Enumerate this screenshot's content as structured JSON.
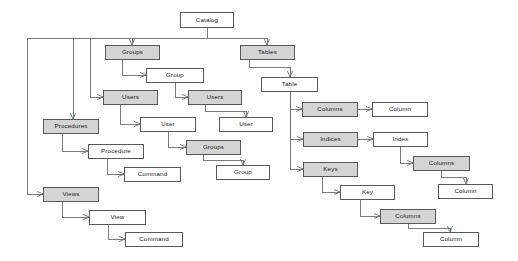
{
  "diagram": {
    "type": "tree-diagram",
    "style": {
      "shaded_fill": "#d4d4d4",
      "plain_fill": "#ffffff",
      "border_color": "#595959",
      "edge_color": "#6e6e6e",
      "background": "#ffffff"
    },
    "nodes": [
      {
        "id": "catalog",
        "label": "Catalog",
        "fill": "plain",
        "x": 180,
        "y": 12,
        "w": 54,
        "h": 16
      },
      {
        "id": "groups",
        "label": "Groups",
        "fill": "shaded",
        "x": 105,
        "y": 45,
        "w": 55,
        "h": 15
      },
      {
        "id": "group",
        "label": "Group",
        "fill": "plain",
        "x": 146,
        "y": 68,
        "w": 58,
        "h": 15
      },
      {
        "id": "users",
        "label": "Users",
        "fill": "shaded",
        "x": 103,
        "y": 90,
        "w": 55,
        "h": 15
      },
      {
        "id": "user",
        "label": "User",
        "fill": "plain",
        "x": 140,
        "y": 117,
        "w": 56,
        "h": 15
      },
      {
        "id": "users2",
        "label": "Users",
        "fill": "shaded",
        "x": 188,
        "y": 90,
        "w": 54,
        "h": 15
      },
      {
        "id": "user2",
        "label": "User",
        "fill": "plain",
        "x": 219,
        "y": 117,
        "w": 54,
        "h": 15
      },
      {
        "id": "groups2",
        "label": "Groups",
        "fill": "shaded",
        "x": 186,
        "y": 140,
        "w": 55,
        "h": 15
      },
      {
        "id": "group2",
        "label": "Group",
        "fill": "plain",
        "x": 216,
        "y": 165,
        "w": 54,
        "h": 15
      },
      {
        "id": "procedures",
        "label": "Procedures",
        "fill": "shaded",
        "x": 43,
        "y": 119,
        "w": 56,
        "h": 15
      },
      {
        "id": "procedure",
        "label": "Procedure",
        "fill": "plain",
        "x": 88,
        "y": 144,
        "w": 56,
        "h": 15
      },
      {
        "id": "proc_command",
        "label": "Command",
        "fill": "plain",
        "x": 124,
        "y": 167,
        "w": 57,
        "h": 15
      },
      {
        "id": "views",
        "label": "Views",
        "fill": "shaded",
        "x": 43,
        "y": 187,
        "w": 56,
        "h": 15
      },
      {
        "id": "view",
        "label": "View",
        "fill": "plain",
        "x": 89,
        "y": 210,
        "w": 57,
        "h": 15
      },
      {
        "id": "view_command",
        "label": "Command",
        "fill": "plain",
        "x": 125,
        "y": 232,
        "w": 58,
        "h": 15
      },
      {
        "id": "tables",
        "label": "Tables",
        "fill": "shaded",
        "x": 240,
        "y": 45,
        "w": 55,
        "h": 15
      },
      {
        "id": "table",
        "label": "Table",
        "fill": "plain",
        "x": 261,
        "y": 77,
        "w": 57,
        "h": 15
      },
      {
        "id": "columns",
        "label": "Columns",
        "fill": "shaded",
        "x": 302,
        "y": 102,
        "w": 56,
        "h": 15
      },
      {
        "id": "column",
        "label": "Column",
        "fill": "plain",
        "x": 372,
        "y": 102,
        "w": 56,
        "h": 15
      },
      {
        "id": "indices",
        "label": "Indices",
        "fill": "shaded",
        "x": 303,
        "y": 132,
        "w": 55,
        "h": 15
      },
      {
        "id": "index",
        "label": "Index",
        "fill": "plain",
        "x": 373,
        "y": 132,
        "w": 55,
        "h": 15
      },
      {
        "id": "idx_columns",
        "label": "Columns",
        "fill": "shaded",
        "x": 413,
        "y": 156,
        "w": 57,
        "h": 15
      },
      {
        "id": "idx_column",
        "label": "Column",
        "fill": "plain",
        "x": 438,
        "y": 184,
        "w": 55,
        "h": 15
      },
      {
        "id": "keys",
        "label": "Keys",
        "fill": "shaded",
        "x": 303,
        "y": 162,
        "w": 55,
        "h": 15
      },
      {
        "id": "key",
        "label": "Key",
        "fill": "plain",
        "x": 340,
        "y": 185,
        "w": 55,
        "h": 15
      },
      {
        "id": "key_columns",
        "label": "Columns",
        "fill": "shaded",
        "x": 380,
        "y": 209,
        "w": 56,
        "h": 15
      },
      {
        "id": "key_column",
        "label": "Column",
        "fill": "plain",
        "x": 423,
        "y": 232,
        "w": 56,
        "h": 15
      }
    ],
    "edges": [
      {
        "from": "catalog",
        "to": "bus",
        "points": "207,28 207,38"
      },
      {
        "from": "bus",
        "to": "bus-left",
        "points": "207,38 27,38"
      },
      {
        "from": "bus",
        "to": "tables",
        "points": "207,38 267,38 267,45",
        "arrow": true
      },
      {
        "from": "bus",
        "to": "groups",
        "points": "132,38 132,45",
        "arrow": true
      },
      {
        "from": "bus",
        "to": "users",
        "points": "90,38 90,97 103,97",
        "arrow": true
      },
      {
        "from": "bus",
        "to": "procedures",
        "points": "73,38 73,119",
        "arrow": true
      },
      {
        "from": "bus",
        "to": "views",
        "points": "27,38 27,194 43,194",
        "arrow": true
      },
      {
        "from": "groups",
        "to": "group",
        "points": "122,60 122,75 146,75",
        "arrow": true
      },
      {
        "from": "group",
        "to": "users2",
        "points": "175,83 175,97 188,97",
        "arrow": true
      },
      {
        "from": "users",
        "to": "user",
        "points": "120,105 120,124 140,124",
        "arrow": true
      },
      {
        "from": "users2",
        "to": "user2",
        "points": "205,105 205,111 246,111 246,117",
        "arrow": true
      },
      {
        "from": "user",
        "to": "groups2",
        "points": "168,132 168,147 186,147",
        "arrow": true
      },
      {
        "from": "groups2",
        "to": "group2",
        "points": "203,155 203,160 243,160 243,165",
        "arrow": true
      },
      {
        "from": "procedures",
        "to": "procedure",
        "points": "62,134 62,151 88,151",
        "arrow": true
      },
      {
        "from": "procedure",
        "to": "proc_command",
        "points": "107,159 107,174 124,174",
        "arrow": true
      },
      {
        "from": "views",
        "to": "view",
        "points": "62,202 62,217 89,217",
        "arrow": true
      },
      {
        "from": "view",
        "to": "view_command",
        "points": "108,225 108,239 125,239",
        "arrow": true
      },
      {
        "from": "tables",
        "to": "table",
        "points": "249,60 249,67 290,67 290,77",
        "arrow": true
      },
      {
        "from": "table",
        "to": "columns",
        "points": "290,92 290,109 302,109",
        "arrow": true
      },
      {
        "from": "table",
        "to": "indices",
        "points": "290,92 290,139 303,139",
        "arrow": true
      },
      {
        "from": "table",
        "to": "keys",
        "points": "290,92 290,169 303,169",
        "arrow": true
      },
      {
        "from": "columns",
        "to": "column",
        "points": "358,109 372,109",
        "arrow": true
      },
      {
        "from": "indices",
        "to": "index",
        "points": "358,139 373,139",
        "arrow": true
      },
      {
        "from": "index",
        "to": "idx_columns",
        "points": "400,147 400,163 413,163",
        "arrow": true
      },
      {
        "from": "idx_columns",
        "to": "idx_column",
        "points": "441,171 441,177 466,177 466,184",
        "arrow": true
      },
      {
        "from": "keys",
        "to": "key",
        "points": "322,177 322,192 340,192",
        "arrow": true
      },
      {
        "from": "key",
        "to": "key_columns",
        "points": "360,200 360,216 380,216",
        "arrow": true
      },
      {
        "from": "key_columns",
        "to": "key_column",
        "points": "408,224 408,228 450,228 450,232",
        "arrow": true
      }
    ]
  }
}
